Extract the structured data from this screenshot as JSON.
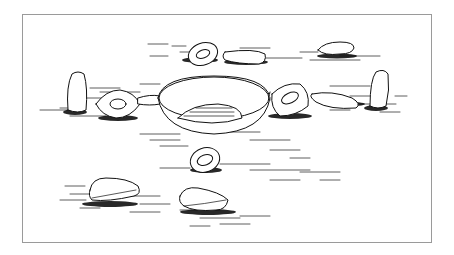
{
  "illustration": {
    "description": "Pen-and-ink drawing of a central shallow bowl surrounded by flat stones, ring stones and two upright standing stones on hatched ground",
    "frame_color": "#9a9a9a",
    "ink_color": "#111111",
    "background": "#ffffff"
  }
}
